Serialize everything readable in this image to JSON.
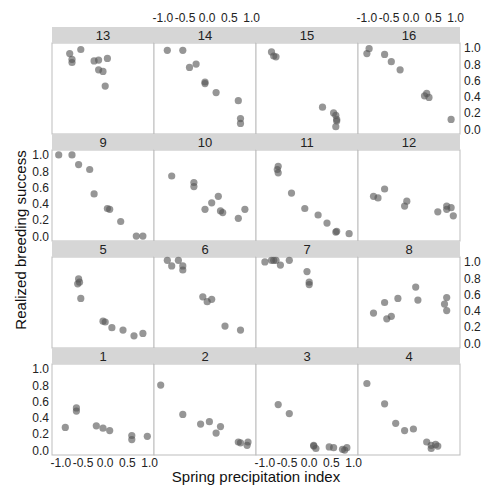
{
  "chart_data": {
    "type": "scatter",
    "title": "",
    "xlabel": "Spring precipitation index",
    "ylabel": "Realized breeding success",
    "xlim": [
      -1.2,
      1.1
    ],
    "ylim": [
      -0.06,
      1.06
    ],
    "x_ticks": [
      "-1.0",
      "-0.5",
      "0.0",
      "0.5",
      "1.0"
    ],
    "y_ticks": [
      "0.0",
      "0.2",
      "0.4",
      "0.6",
      "0.8",
      "1.0"
    ],
    "grid": false,
    "layout": {
      "rows": 4,
      "cols": 4,
      "panel_order": [
        [
          13,
          14,
          15,
          16
        ],
        [
          9,
          10,
          11,
          12
        ],
        [
          5,
          6,
          7,
          8
        ],
        [
          1,
          2,
          3,
          4
        ]
      ]
    },
    "panels": [
      {
        "id": "13",
        "points": [
          [
            -0.8,
            0.93
          ],
          [
            -0.75,
            0.86
          ],
          [
            -0.75,
            0.82
          ],
          [
            -0.55,
            0.98
          ],
          [
            -0.25,
            0.84
          ],
          [
            -0.15,
            0.85
          ],
          [
            -0.15,
            0.73
          ],
          [
            -0.05,
            0.71
          ],
          [
            0.05,
            0.87
          ],
          [
            0.0,
            0.53
          ]
        ]
      },
      {
        "id": "14",
        "points": [
          [
            -0.9,
            0.97
          ],
          [
            -0.55,
            0.97
          ],
          [
            -0.4,
            0.76
          ],
          [
            -0.25,
            0.8
          ],
          [
            -0.05,
            0.58
          ],
          [
            -0.05,
            0.56
          ],
          [
            0.2,
            0.45
          ],
          [
            0.7,
            0.35
          ],
          [
            0.75,
            0.13
          ],
          [
            0.75,
            0.07
          ]
        ]
      },
      {
        "id": "15",
        "points": [
          [
            -0.85,
            0.95
          ],
          [
            -0.8,
            0.9
          ],
          [
            -0.75,
            0.89
          ],
          [
            0.3,
            0.27
          ],
          [
            0.55,
            0.2
          ],
          [
            0.6,
            0.17
          ],
          [
            0.62,
            0.12
          ],
          [
            0.62,
            0.1
          ],
          [
            0.6,
            0.03
          ]
        ]
      },
      {
        "id": "16",
        "points": [
          [
            -1.0,
            0.93
          ],
          [
            -0.95,
            0.99
          ],
          [
            -0.6,
            0.92
          ],
          [
            -0.45,
            0.83
          ],
          [
            -0.25,
            0.73
          ],
          [
            0.3,
            0.41
          ],
          [
            0.35,
            0.44
          ],
          [
            0.4,
            0.39
          ],
          [
            0.9,
            0.12
          ]
        ]
      },
      {
        "id": "9",
        "points": [
          [
            -1.05,
            1.0
          ],
          [
            -0.75,
            1.0
          ],
          [
            -0.6,
            0.88
          ],
          [
            -0.35,
            0.82
          ],
          [
            -0.25,
            0.52
          ],
          [
            0.05,
            0.34
          ],
          [
            0.1,
            0.33
          ],
          [
            0.35,
            0.18
          ],
          [
            0.7,
            0.0
          ],
          [
            0.85,
            0.0
          ]
        ]
      },
      {
        "id": "10",
        "points": [
          [
            -0.8,
            0.74
          ],
          [
            -0.3,
            0.66
          ],
          [
            -0.3,
            0.61
          ],
          [
            -0.05,
            0.33
          ],
          [
            0.1,
            0.41
          ],
          [
            0.25,
            0.49
          ],
          [
            0.3,
            0.31
          ],
          [
            0.35,
            0.29
          ],
          [
            0.7,
            0.22
          ],
          [
            0.85,
            0.33
          ]
        ]
      },
      {
        "id": "11",
        "points": [
          [
            -0.7,
            0.86
          ],
          [
            -0.72,
            0.82
          ],
          [
            -0.7,
            0.78
          ],
          [
            -0.4,
            0.53
          ],
          [
            -0.1,
            0.34
          ],
          [
            0.2,
            0.26
          ],
          [
            0.4,
            0.16
          ],
          [
            0.6,
            0.05
          ],
          [
            0.62,
            0.06
          ],
          [
            0.9,
            0.03
          ]
        ]
      },
      {
        "id": "12",
        "points": [
          [
            -0.85,
            0.49
          ],
          [
            -0.75,
            0.47
          ],
          [
            -0.6,
            0.58
          ],
          [
            -0.15,
            0.37
          ],
          [
            -0.1,
            0.43
          ],
          [
            0.6,
            0.3
          ],
          [
            0.8,
            0.33
          ],
          [
            0.8,
            0.37
          ],
          [
            0.9,
            0.35
          ],
          [
            0.95,
            0.25
          ]
        ]
      },
      {
        "id": "5",
        "points": [
          [
            -0.62,
            0.73
          ],
          [
            -0.6,
            0.79
          ],
          [
            -0.58,
            0.75
          ],
          [
            -0.55,
            0.55
          ],
          [
            -0.05,
            0.27
          ],
          [
            0.0,
            0.26
          ],
          [
            0.15,
            0.19
          ],
          [
            0.4,
            0.16
          ],
          [
            0.65,
            0.09
          ],
          [
            0.85,
            0.12
          ]
        ]
      },
      {
        "id": "6",
        "points": [
          [
            -0.9,
            1.02
          ],
          [
            -0.8,
            0.95
          ],
          [
            -0.65,
            1.02
          ],
          [
            -0.55,
            0.95
          ],
          [
            -0.55,
            0.9
          ],
          [
            -0.1,
            0.57
          ],
          [
            0.0,
            0.51
          ],
          [
            0.1,
            0.54
          ],
          [
            0.4,
            0.21
          ],
          [
            0.75,
            0.16
          ]
        ]
      },
      {
        "id": "7",
        "points": [
          [
            -1.0,
            1.0
          ],
          [
            -0.85,
            1.02
          ],
          [
            -0.8,
            1.02
          ],
          [
            -0.75,
            1.02
          ],
          [
            -0.65,
            0.96
          ],
          [
            -0.45,
            1.02
          ],
          [
            -0.05,
            0.88
          ],
          [
            0.0,
            0.75
          ],
          [
            0.0,
            0.72
          ]
        ]
      },
      {
        "id": "8",
        "points": [
          [
            -0.85,
            0.37
          ],
          [
            -0.6,
            0.5
          ],
          [
            -0.55,
            0.3
          ],
          [
            -0.45,
            0.33
          ],
          [
            -0.3,
            0.55
          ],
          [
            0.1,
            0.69
          ],
          [
            0.15,
            0.53
          ],
          [
            0.75,
            0.48
          ],
          [
            0.8,
            0.56
          ],
          [
            0.8,
            0.4
          ]
        ]
      },
      {
        "id": "1",
        "points": [
          [
            -0.9,
            0.28
          ],
          [
            -0.65,
            0.52
          ],
          [
            -0.65,
            0.48
          ],
          [
            -0.2,
            0.3
          ],
          [
            -0.05,
            0.27
          ],
          [
            0.1,
            0.24
          ],
          [
            0.6,
            0.18
          ],
          [
            0.6,
            0.13
          ],
          [
            0.95,
            0.17
          ]
        ]
      },
      {
        "id": "2",
        "points": [
          [
            -1.05,
            0.8
          ],
          [
            -0.55,
            0.44
          ],
          [
            -0.15,
            0.32
          ],
          [
            0.05,
            0.35
          ],
          [
            0.2,
            0.21
          ],
          [
            0.3,
            0.29
          ],
          [
            0.7,
            0.1
          ],
          [
            0.75,
            0.09
          ],
          [
            0.9,
            0.06
          ],
          [
            0.92,
            0.1
          ]
        ]
      },
      {
        "id": "3",
        "points": [
          [
            -0.7,
            0.56
          ],
          [
            -0.45,
            0.45
          ],
          [
            0.1,
            0.06
          ],
          [
            0.1,
            0.05
          ],
          [
            0.15,
            0.02
          ],
          [
            0.45,
            0.04
          ],
          [
            0.55,
            0.03
          ],
          [
            0.75,
            0.01
          ],
          [
            0.8,
            0.0
          ],
          [
            0.85,
            0.03
          ]
        ]
      },
      {
        "id": "4",
        "points": [
          [
            -1.0,
            0.82
          ],
          [
            -0.6,
            0.57
          ],
          [
            -0.35,
            0.33
          ],
          [
            -0.15,
            0.24
          ],
          [
            0.05,
            0.26
          ],
          [
            0.35,
            0.1
          ],
          [
            0.45,
            0.06
          ],
          [
            0.45,
            0.02
          ],
          [
            0.55,
            0.07
          ],
          [
            0.6,
            0.05
          ]
        ]
      }
    ]
  },
  "labels": {
    "xlabel": "Spring precipitation index",
    "ylabel": "Realized breeding success"
  }
}
